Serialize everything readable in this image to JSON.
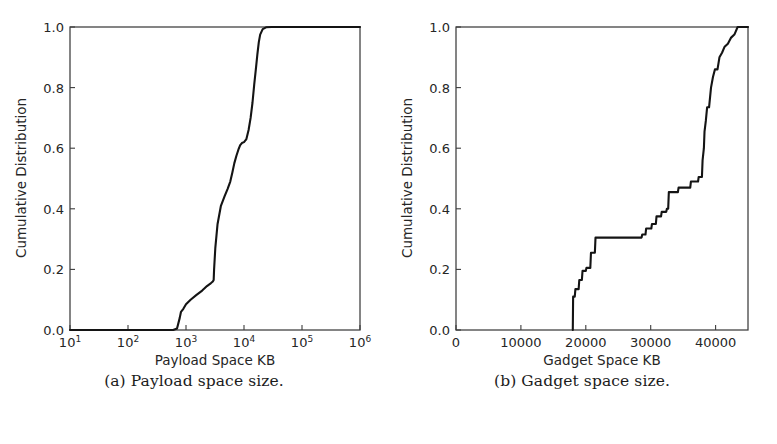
{
  "figure": {
    "background": "#ffffff",
    "line_color": "#141414",
    "axis_color": "#3c3c3c",
    "text_color": "#262626"
  },
  "subfigures": [
    {
      "caption": "(a) Payload space size.",
      "chart_data": {
        "type": "line",
        "title": "",
        "xlabel": "Payload Space KB",
        "ylabel": "Cumulative Distribution",
        "xscale": "log",
        "yscale": "linear",
        "xlim": [
          10,
          1000000
        ],
        "ylim": [
          0.0,
          1.0
        ],
        "grid": false,
        "legend": null,
        "xticks": [
          10,
          100,
          1000,
          10000,
          100000,
          1000000
        ],
        "xticklabels": [
          "10^1",
          "10^2",
          "10^3",
          "10^4",
          "10^5",
          "10^6"
        ],
        "xtick_mantissa": [
          "10",
          "10",
          "10",
          "10",
          "10",
          "10"
        ],
        "xtick_exponent": [
          "1",
          "2",
          "3",
          "4",
          "5",
          "6"
        ],
        "yticks": [
          0.0,
          0.2,
          0.4,
          0.6,
          0.8,
          1.0
        ],
        "yticklabels": [
          "0.0",
          "0.2",
          "0.4",
          "0.6",
          "0.8",
          "1.0"
        ],
        "series": [
          {
            "name": "payload space CDF",
            "x": [
              10,
              100,
              300,
              600,
              700,
              780,
              820,
              900,
              1000,
              1200,
              1500,
              1900,
              2300,
              2700,
              2900,
              3000,
              3050,
              3200,
              3500,
              4000,
              4600,
              5200,
              5800,
              6300,
              6800,
              7400,
              8000,
              8600,
              9200,
              10000,
              11000,
              12000,
              13000,
              14000,
              15000,
              16000,
              17000,
              18000,
              19000,
              21000,
              24000,
              30000,
              50000,
              100000,
              300000,
              1000000
            ],
            "y": [
              0.0,
              0.0,
              0.0,
              0.0,
              0.005,
              0.04,
              0.06,
              0.07,
              0.085,
              0.1,
              0.115,
              0.13,
              0.145,
              0.155,
              0.16,
              0.165,
              0.2,
              0.27,
              0.35,
              0.41,
              0.44,
              0.465,
              0.49,
              0.52,
              0.55,
              0.575,
              0.595,
              0.61,
              0.617,
              0.62,
              0.63,
              0.66,
              0.7,
              0.75,
              0.81,
              0.86,
              0.91,
              0.95,
              0.975,
              0.993,
              0.999,
              1.0,
              1.0,
              1.0,
              1.0,
              1.0
            ]
          }
        ]
      }
    },
    {
      "caption": "(b) Gadget space size.",
      "chart_data": {
        "type": "line",
        "title": "",
        "xlabel": "Gadget Space KB",
        "ylabel": "Cumulative Distribution",
        "xscale": "linear",
        "yscale": "linear",
        "xlim": [
          0,
          45000
        ],
        "ylim": [
          0.0,
          1.0
        ],
        "grid": false,
        "legend": null,
        "xticks": [
          0,
          10000,
          20000,
          30000,
          40000
        ],
        "xticklabels": [
          "0",
          "10000",
          "20000",
          "30000",
          "40000"
        ],
        "yticks": [
          0.0,
          0.2,
          0.4,
          0.6,
          0.8,
          1.0
        ],
        "yticklabels": [
          "0.0",
          "0.2",
          "0.4",
          "0.6",
          "0.8",
          "1.0"
        ],
        "series": [
          {
            "name": "gadget space CDF",
            "x": [
              18000,
              18050,
              18300,
              18400,
              18900,
              19000,
              19400,
              19500,
              20000,
              20100,
              20700,
              20800,
              21400,
              21500,
              28600,
              28700,
              29200,
              29300,
              30100,
              30200,
              30800,
              30900,
              31600,
              31700,
              32400,
              32500,
              32700,
              32800,
              34200,
              34300,
              36100,
              36200,
              37300,
              37400,
              37900,
              38000,
              38200,
              38300,
              38500,
              38700,
              39000,
              39300,
              39600,
              39900,
              40300,
              40600,
              41000,
              41400,
              41900,
              42400,
              42900,
              43100,
              43400,
              45000
            ],
            "y": [
              0.0,
              0.11,
              0.11,
              0.135,
              0.135,
              0.165,
              0.165,
              0.195,
              0.195,
              0.205,
              0.205,
              0.255,
              0.255,
              0.305,
              0.305,
              0.315,
              0.315,
              0.335,
              0.335,
              0.35,
              0.35,
              0.375,
              0.375,
              0.39,
              0.39,
              0.4,
              0.4,
              0.455,
              0.455,
              0.47,
              0.47,
              0.49,
              0.49,
              0.505,
              0.505,
              0.56,
              0.6,
              0.655,
              0.69,
              0.735,
              0.735,
              0.8,
              0.835,
              0.86,
              0.86,
              0.9,
              0.915,
              0.935,
              0.945,
              0.965,
              0.975,
              0.985,
              1.0,
              1.0
            ]
          }
        ]
      }
    }
  ]
}
